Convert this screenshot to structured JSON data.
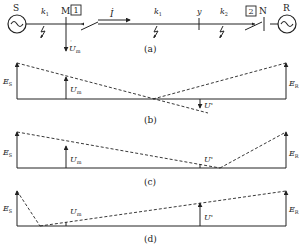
{
  "diagram": {
    "panel_a": {
      "caption": "(a)",
      "source_left": "S",
      "source_right": "R",
      "bus_left": "M",
      "bus_right": "N",
      "breaker_left": "1",
      "breaker_right": "2",
      "current": "İ",
      "faults": [
        "k",
        "k",
        "k"
      ],
      "fault_subs": [
        "1",
        "1",
        "2"
      ],
      "point_y": "y",
      "measured_voltage": "U",
      "measured_voltage_sub": "m"
    },
    "panel_b": {
      "caption": "(b)",
      "es": "E",
      "es_sub": "S",
      "er": "E",
      "er_sub": "R",
      "um": "U",
      "um_sub": "m",
      "up": "U'"
    },
    "panel_c": {
      "caption": "(c)",
      "es": "E",
      "es_sub": "S",
      "er": "E",
      "er_sub": "R",
      "um": "U",
      "um_sub": "m",
      "up": "U'"
    },
    "panel_d": {
      "caption": "(d)",
      "es": "E",
      "es_sub": "S",
      "er": "E",
      "er_sub": "R",
      "um": "U",
      "um_sub": "m",
      "up": "U'"
    }
  }
}
